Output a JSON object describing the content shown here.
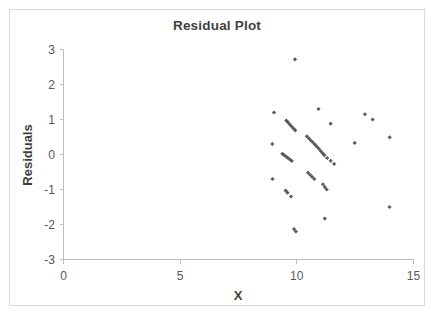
{
  "chart_data": {
    "type": "scatter",
    "title": "Residual Plot",
    "xlabel": "X",
    "ylabel": "Residuals",
    "xlim": [
      0,
      15
    ],
    "ylim": [
      -3,
      3
    ],
    "xticks": [
      0,
      5,
      10,
      15
    ],
    "yticks": [
      -3,
      -2,
      -1,
      0,
      1,
      2,
      3
    ],
    "xtick_labels": [
      "0",
      "5",
      "10",
      "15"
    ],
    "ytick_labels": [
      "-3",
      "-2",
      "-1",
      "0",
      "1",
      "2",
      "3"
    ],
    "grid": false,
    "legend": false,
    "marker_color": "#5a5a5a",
    "marker_shape": "diamond",
    "series": [
      {
        "name": "Residuals",
        "points": [
          [
            9.92,
            2.72
          ],
          [
            9.02,
            1.2
          ],
          [
            10.93,
            1.3
          ],
          [
            12.92,
            1.15
          ],
          [
            13.25,
            1.0
          ],
          [
            9.55,
            0.97
          ],
          [
            9.62,
            0.92
          ],
          [
            9.7,
            0.86
          ],
          [
            9.78,
            0.8
          ],
          [
            9.86,
            0.74
          ],
          [
            9.93,
            0.69
          ],
          [
            11.45,
            0.88
          ],
          [
            10.43,
            0.52
          ],
          [
            10.52,
            0.46
          ],
          [
            10.6,
            0.4
          ],
          [
            10.68,
            0.35
          ],
          [
            10.77,
            0.29
          ],
          [
            10.85,
            0.23
          ],
          [
            10.94,
            0.17
          ],
          [
            11.02,
            0.1
          ],
          [
            11.1,
            0.04
          ],
          [
            11.18,
            -0.02
          ],
          [
            11.3,
            -0.1
          ],
          [
            11.45,
            -0.18
          ],
          [
            11.6,
            -0.27
          ],
          [
            12.48,
            0.33
          ],
          [
            13.98,
            0.49
          ],
          [
            8.95,
            0.3
          ],
          [
            9.38,
            0.02
          ],
          [
            9.46,
            -0.02
          ],
          [
            9.54,
            -0.06
          ],
          [
            9.62,
            -0.1
          ],
          [
            9.7,
            -0.14
          ],
          [
            9.78,
            -0.18
          ],
          [
            10.48,
            -0.52
          ],
          [
            10.57,
            -0.58
          ],
          [
            10.66,
            -0.64
          ],
          [
            10.75,
            -0.7
          ],
          [
            11.12,
            -0.85
          ],
          [
            11.2,
            -0.93
          ],
          [
            11.28,
            -1.0
          ],
          [
            8.96,
            -0.7
          ],
          [
            9.52,
            -1.03
          ],
          [
            9.6,
            -1.09
          ],
          [
            9.75,
            -1.2
          ],
          [
            11.2,
            -1.83
          ],
          [
            9.88,
            -2.13
          ],
          [
            9.96,
            -2.2
          ],
          [
            13.97,
            -1.5
          ]
        ]
      }
    ]
  }
}
